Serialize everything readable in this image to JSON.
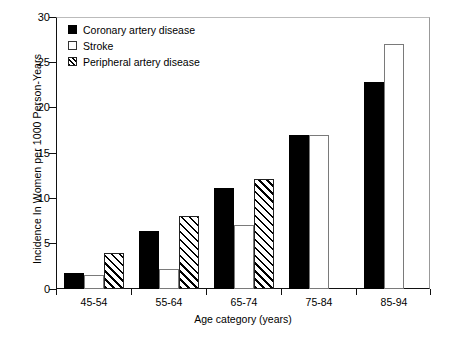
{
  "chart_data": {
    "type": "bar",
    "title": "",
    "xlabel": "Age category (years)",
    "ylabel": "Incidence In Women per 1000 Person-Years",
    "categories": [
      "45-54",
      "55-64",
      "65-74",
      "75-84",
      "85-94"
    ],
    "ylim": [
      0,
      30
    ],
    "yticks": [
      0,
      5,
      10,
      15,
      20,
      25,
      30
    ],
    "grid": false,
    "legend_position": "top-left",
    "series": [
      {
        "name": "Coronary artery disease",
        "style": "solid-black",
        "values": [
          1.8,
          6.4,
          11.1,
          17.0,
          22.8
        ]
      },
      {
        "name": "Stroke",
        "style": "open-white",
        "values": [
          1.5,
          2.2,
          7.1,
          17.0,
          27.0
        ]
      },
      {
        "name": "Peripheral artery disease",
        "style": "hatched",
        "values": [
          4.0,
          8.1,
          12.1,
          null,
          null
        ]
      }
    ]
  },
  "axes": {
    "ytick_labels": [
      "0",
      "5",
      "10",
      "15",
      "20",
      "25",
      "30"
    ],
    "xtick_labels": [
      "45-54",
      "55-64",
      "65-74",
      "75-84",
      "85-94"
    ],
    "ylabel": "Incidence In Women per 1000 Person-Years",
    "xlabel": "Age category (years)"
  },
  "legend": {
    "items": [
      {
        "label": "Coronary artery disease",
        "swatch": "filled-square-icon"
      },
      {
        "label": "Stroke",
        "swatch": "open-square-icon"
      },
      {
        "label": "Peripheral artery disease",
        "swatch": "hatched-square-icon"
      }
    ]
  }
}
